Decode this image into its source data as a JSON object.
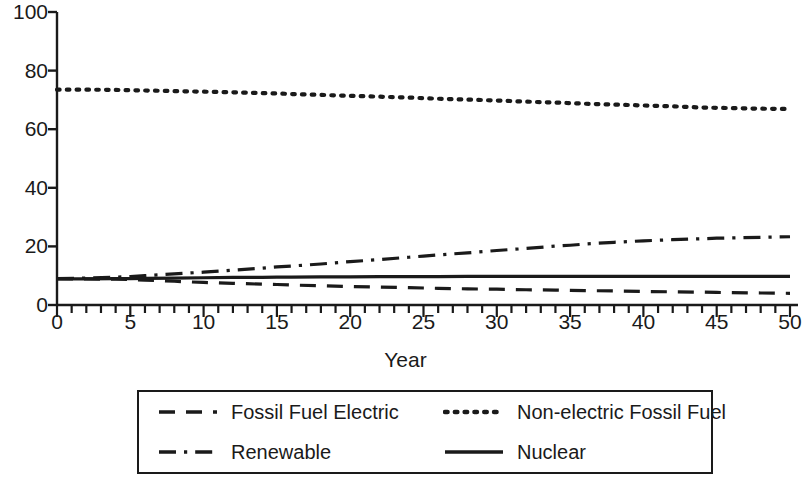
{
  "chart_data": {
    "type": "line",
    "title": "",
    "xlabel": "Year",
    "ylabel": "",
    "xlim": [
      0,
      50
    ],
    "ylim": [
      0,
      100
    ],
    "xticks": [
      0,
      5,
      10,
      15,
      20,
      25,
      30,
      35,
      40,
      45,
      50
    ],
    "xtick_labels": [
      "0",
      "5",
      "10",
      "15",
      "20",
      "25",
      "30",
      "35",
      "40",
      "45",
      "50"
    ],
    "xminor_tick_step": 1,
    "yticks": [
      0,
      20,
      40,
      60,
      80,
      100
    ],
    "ytick_labels": [
      "0",
      "20",
      "40",
      "60",
      "80",
      "100"
    ],
    "grid": false,
    "legend_position": "below-center",
    "legend_columns": 2,
    "line_color": "#1a1a1a",
    "x": [
      0,
      2,
      4,
      5,
      6,
      8,
      10,
      12,
      14,
      15,
      16,
      18,
      20,
      22,
      24,
      25,
      26,
      28,
      30,
      32,
      34,
      35,
      36,
      38,
      40,
      42,
      44,
      45,
      46,
      48,
      50
    ],
    "series": [
      {
        "name": "Fossil Fuel Electric",
        "style": "dashed",
        "values": [
          9.0,
          8.9,
          8.8,
          8.7,
          8.5,
          8.1,
          7.7,
          7.4,
          7.1,
          7.0,
          6.8,
          6.6,
          6.3,
          6.1,
          5.9,
          5.8,
          5.7,
          5.5,
          5.4,
          5.2,
          5.1,
          5.0,
          4.9,
          4.8,
          4.6,
          4.5,
          4.4,
          4.3,
          4.2,
          4.1,
          4.0
        ]
      },
      {
        "name": "Non-electric Fossil Fuel",
        "style": "dotted",
        "values": [
          73.5,
          73.5,
          73.4,
          73.3,
          73.2,
          73.0,
          72.8,
          72.6,
          72.3,
          72.2,
          72.0,
          71.7,
          71.4,
          71.1,
          70.8,
          70.6,
          70.4,
          70.1,
          69.8,
          69.4,
          69.1,
          68.9,
          68.7,
          68.4,
          68.1,
          67.8,
          67.4,
          67.3,
          67.2,
          67.0,
          66.9
        ]
      },
      {
        "name": "Renewable",
        "style": "dash-dot",
        "values": [
          9.0,
          9.2,
          9.5,
          9.7,
          10.0,
          10.6,
          11.2,
          11.9,
          12.6,
          13.0,
          13.3,
          14.0,
          14.8,
          15.5,
          16.3,
          16.7,
          17.1,
          17.8,
          18.6,
          19.3,
          20.1,
          20.4,
          20.8,
          21.4,
          21.9,
          22.3,
          22.6,
          22.8,
          22.9,
          23.1,
          23.3
        ]
      },
      {
        "name": "Nuclear",
        "style": "solid",
        "values": [
          8.9,
          8.9,
          9.0,
          9.0,
          9.1,
          9.2,
          9.3,
          9.4,
          9.4,
          9.5,
          9.5,
          9.6,
          9.6,
          9.7,
          9.7,
          9.7,
          9.7,
          9.8,
          9.8,
          9.8,
          9.8,
          9.8,
          9.8,
          9.8,
          9.8,
          9.8,
          9.8,
          9.8,
          9.8,
          9.8,
          9.8
        ]
      }
    ]
  },
  "legend": {
    "items": [
      {
        "label": "Fossil Fuel Electric",
        "style": "dashed"
      },
      {
        "label": "Non-electric Fossil Fuel",
        "style": "dotted"
      },
      {
        "label": "Renewable",
        "style": "dash-dot"
      },
      {
        "label": "Nuclear",
        "style": "solid"
      }
    ]
  }
}
